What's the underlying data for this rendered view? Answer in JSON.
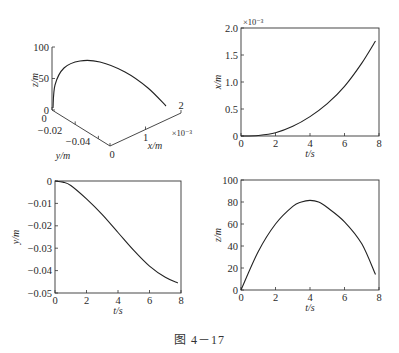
{
  "header_text_fragment": "",
  "figure_caption": "图 4－17",
  "chart_data": [
    {
      "id": "trajectory-3d",
      "type": "line",
      "title": "",
      "projection": "3d",
      "xlabel": "x/m",
      "ylabel": "y/m",
      "zlabel": "z/m",
      "x_ticks": [
        "0",
        "1",
        "2"
      ],
      "x_multiplier": "×10⁻³",
      "y_ticks": [
        "0",
        "-0.02",
        "-0.04"
      ],
      "z_ticks": [
        "0",
        "50",
        "100"
      ],
      "series": [
        {
          "name": "trajectory",
          "x": [
            0,
            0.0001,
            0.0004,
            0.0008,
            0.0012,
            0.0016,
            0.00175
          ],
          "y": [
            0,
            -0.003,
            -0.012,
            -0.025,
            -0.036,
            -0.043,
            -0.045
          ],
          "z": [
            0,
            40,
            68,
            80,
            72,
            48,
            14
          ]
        }
      ]
    },
    {
      "id": "x-vs-t",
      "type": "line",
      "title": "",
      "xlabel": "t/s",
      "ylabel": "x/m",
      "y_multiplier": "×10⁻³",
      "xlim": [
        0,
        8
      ],
      "ylim": [
        0,
        2.0
      ],
      "x_ticks": [
        "0",
        "2",
        "4",
        "6",
        "8"
      ],
      "y_ticks": [
        "0",
        "0.5",
        "1.0",
        "1.5",
        "2.0"
      ],
      "grid": false,
      "series": [
        {
          "name": "x(t)",
          "x": [
            0,
            1,
            2,
            3,
            4,
            5,
            6,
            7,
            7.8
          ],
          "y": [
            0,
            0.01,
            0.06,
            0.18,
            0.36,
            0.6,
            0.92,
            1.35,
            1.76
          ]
        }
      ]
    },
    {
      "id": "y-vs-t",
      "type": "line",
      "title": "",
      "xlabel": "t/s",
      "ylabel": "y/m",
      "xlim": [
        0,
        8
      ],
      "ylim": [
        -0.05,
        0
      ],
      "x_ticks": [
        "0",
        "2",
        "4",
        "6",
        "8"
      ],
      "y_ticks": [
        "0",
        "-0.01",
        "-0.02",
        "-0.03",
        "-0.04",
        "-0.05"
      ],
      "grid": false,
      "series": [
        {
          "name": "y(t)",
          "x": [
            0,
            0.5,
            1,
            2,
            3,
            4,
            5,
            6,
            7,
            7.8
          ],
          "y": [
            0,
            -0.0005,
            -0.002,
            -0.008,
            -0.015,
            -0.023,
            -0.031,
            -0.038,
            -0.043,
            -0.0455
          ]
        }
      ]
    },
    {
      "id": "z-vs-t",
      "type": "line",
      "title": "",
      "xlabel": "t/s",
      "ylabel": "z/m",
      "xlim": [
        0,
        8
      ],
      "ylim": [
        0,
        100
      ],
      "x_ticks": [
        "0",
        "2",
        "4",
        "6",
        "8"
      ],
      "y_ticks": [
        "0",
        "20",
        "40",
        "60",
        "80",
        "100"
      ],
      "grid": false,
      "series": [
        {
          "name": "z(t)",
          "x": [
            0,
            1,
            2,
            3,
            3.5,
            4,
            4.5,
            5,
            6,
            7,
            7.8
          ],
          "y": [
            0,
            35,
            60,
            76,
            80,
            81.5,
            80,
            75,
            62,
            42,
            14
          ]
        }
      ]
    }
  ]
}
